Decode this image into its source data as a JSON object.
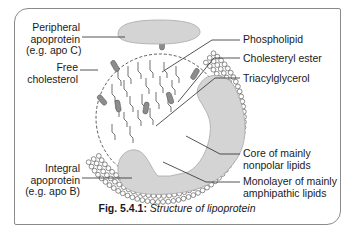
{
  "figure": {
    "caption_number": "Fig. 5.4.1:",
    "caption_title": "Structure of lipoprotein"
  },
  "labels_left": [
    {
      "id": "peripheral-apoprotein",
      "lines": [
        "Peripheral",
        "apoprotein",
        "(e.g. apo C)"
      ]
    },
    {
      "id": "free-cholesterol",
      "lines": [
        "Free",
        "cholesterol"
      ]
    },
    {
      "id": "integral-apoprotein",
      "lines": [
        "Integral",
        "apoprotein",
        "(e.g. apo B)"
      ]
    }
  ],
  "labels_right": [
    {
      "id": "phospholipid",
      "lines": [
        "Phospholipid"
      ]
    },
    {
      "id": "cholesteryl-ester",
      "lines": [
        "Cholesteryl ester"
      ]
    },
    {
      "id": "triacylglycerol",
      "lines": [
        "Triacylglycerol"
      ]
    },
    {
      "id": "core",
      "lines": [
        "Core of mainly",
        "nonpolar lipids"
      ]
    },
    {
      "id": "monolayer",
      "lines": [
        "Monolayer of mainly",
        "amphipathic lipids"
      ]
    }
  ],
  "colors": {
    "protein_fill": "#d4d4d4",
    "protein_stroke": "#a8a8a8",
    "line": "#2a2a2a",
    "frame": "#8a8a8a",
    "cholesterol_fill": "#8c8c8c"
  }
}
